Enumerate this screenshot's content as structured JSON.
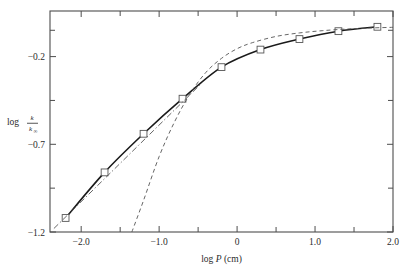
{
  "chart_data": {
    "type": "line",
    "title": "",
    "xlabel": "log P (cm)",
    "ylabel": "log k/k∞",
    "ylabel_parts": {
      "prefix": "log",
      "numerator": "k",
      "denominator": "k",
      "denominator_sub": "∞"
    },
    "xlim": [
      -2.4,
      2.0
    ],
    "ylim": [
      -1.2,
      0.06
    ],
    "grid": false,
    "legend": "none",
    "x_ticks_labeled": [
      {
        "value": -2.0,
        "label": "−2.0"
      },
      {
        "value": -1.0,
        "label": "−1.0"
      },
      {
        "value": 0.0,
        "label": "0"
      },
      {
        "value": 1.0,
        "label": "1.0"
      },
      {
        "value": 2.0,
        "label": "2.0"
      }
    ],
    "x_ticks_minor": [
      -1.5,
      -0.5,
      0.5,
      1.5
    ],
    "y_ticks_labeled": [
      {
        "value": -0.2,
        "label": "−0.2"
      },
      {
        "value": -0.7,
        "label": "−0.7"
      },
      {
        "value": -1.2,
        "label": "−1.2"
      }
    ],
    "y_ticks_minor": [
      -0.05,
      -0.45,
      -0.95
    ],
    "series": [
      {
        "name": "measured",
        "style": "solid-with-markers",
        "marker": "open-square",
        "color": "#1a1a1a",
        "x": [
          -2.2,
          -1.7,
          -1.2,
          -0.7,
          -0.2,
          0.3,
          0.8,
          1.3,
          1.8
        ],
        "y": [
          -1.12,
          -0.86,
          -0.64,
          -0.44,
          -0.26,
          -0.16,
          -0.1,
          -0.055,
          -0.03
        ]
      },
      {
        "name": "theoretical-dashed",
        "style": "dashed",
        "color": "#555555",
        "x": [
          -1.35,
          -1.2,
          -1.0,
          -0.8,
          -0.6,
          -0.4,
          -0.2,
          0.0,
          0.2,
          0.5,
          0.8,
          1.1,
          1.4,
          1.7,
          2.0
        ],
        "y": [
          -1.2,
          -1.02,
          -0.77,
          -0.57,
          -0.41,
          -0.29,
          -0.21,
          -0.155,
          -0.12,
          -0.085,
          -0.065,
          -0.052,
          -0.043,
          -0.037,
          -0.033
        ]
      },
      {
        "name": "limiting-slope-dash-dot",
        "style": "dash-dot",
        "color": "#555555",
        "x": [
          -2.35,
          -0.45
        ],
        "y": [
          -1.18,
          -0.35
        ]
      }
    ]
  },
  "figure": {
    "frame_color": "#4d4d4d",
    "background": "#ffffff"
  }
}
